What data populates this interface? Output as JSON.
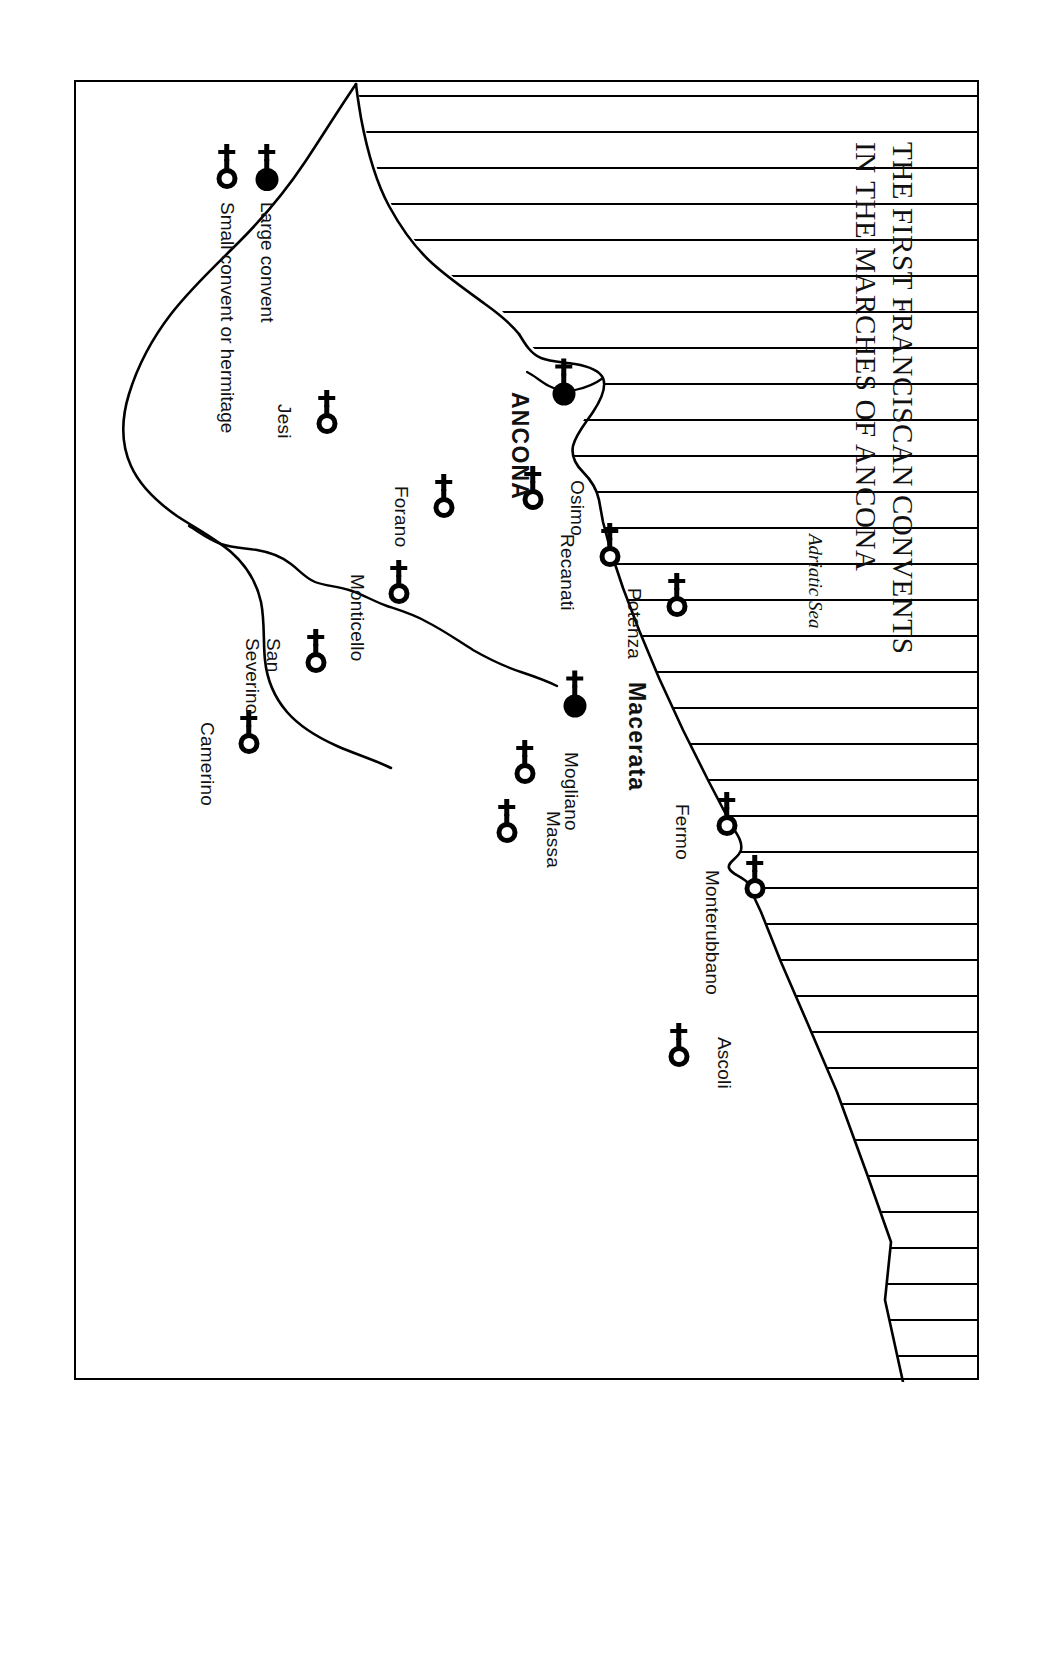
{
  "figure": {
    "title": "THE FIRST FRANCISCAN CONVENTS\nIN THE MARCHES OF ANCONA",
    "orientation_note": "page printed sideways (rotated 90 degrees)"
  },
  "sea": {
    "label": "Adriatic\nSea"
  },
  "legend": {
    "items": [
      {
        "symbol": "large-convent-symbol",
        "label": "Large convent"
      },
      {
        "symbol": "small-convent-symbol",
        "label": "Small convent or hermitage"
      }
    ]
  },
  "map": {
    "places": [
      {
        "name": "ANCONA",
        "type": "large",
        "x": 300,
        "y": 413
      },
      {
        "name": "Macerata",
        "type": "large",
        "x": 612,
        "y": 402
      },
      {
        "name": "Osimo",
        "type": "small",
        "x": 406,
        "y": 444
      },
      {
        "name": "Recanati",
        "type": "small",
        "x": 463,
        "y": 367
      },
      {
        "name": "Potenza",
        "type": "small",
        "x": 513,
        "y": 300
      },
      {
        "name": "Forano",
        "type": "small",
        "x": 414,
        "y": 533
      },
      {
        "name": "Jesi",
        "type": "small",
        "x": 330,
        "y": 650
      },
      {
        "name": "Monticello",
        "type": "small",
        "x": 500,
        "y": 578
      },
      {
        "name": "San\nSeverino",
        "type": "small",
        "x": 569,
        "y": 661
      },
      {
        "name": "Camerino",
        "type": "small",
        "x": 650,
        "y": 728
      },
      {
        "name": "Mogliano",
        "type": "small",
        "x": 680,
        "y": 452
      },
      {
        "name": "Massa",
        "type": "small",
        "x": 739,
        "y": 470
      },
      {
        "name": "Fermo",
        "type": "small",
        "x": 732,
        "y": 250
      },
      {
        "name": "Monterubbano",
        "type": "small",
        "x": 795,
        "y": 222
      },
      {
        "name": "Ascoli",
        "type": "small",
        "x": 963,
        "y": 298
      }
    ],
    "labels": [
      {
        "for": "ANCONA",
        "text": "ANCONA",
        "x": 310,
        "y": 445,
        "style": "big"
      },
      {
        "for": "Macerata",
        "text": "Macerata",
        "x": 600,
        "y": 328,
        "style": "big"
      },
      {
        "for": "Osimo",
        "text": "Osimo",
        "x": 398,
        "y": 390,
        "style": "normal"
      },
      {
        "for": "Recanati",
        "text": "Recanati",
        "x": 452,
        "y": 400,
        "style": "normal"
      },
      {
        "for": "Potenza",
        "text": "Potenza",
        "x": 506,
        "y": 333,
        "style": "normal"
      },
      {
        "for": "Forano",
        "text": "Forano",
        "x": 404,
        "y": 566,
        "style": "normal"
      },
      {
        "for": "Jesi",
        "text": "Jesi",
        "x": 322,
        "y": 683,
        "style": "normal"
      },
      {
        "for": "Monticello",
        "text": "Monticello",
        "x": 492,
        "y": 610,
        "style": "normal"
      },
      {
        "for": "San Severino",
        "text": "San\nSeverino",
        "x": 556,
        "y": 694,
        "style": "normal"
      },
      {
        "for": "Camerino",
        "text": "Camerino",
        "x": 640,
        "y": 760,
        "style": "normal"
      },
      {
        "for": "Mogliano",
        "text": "Mogliano",
        "x": 670,
        "y": 396,
        "style": "normal"
      },
      {
        "for": "Massa",
        "text": "Massa",
        "x": 729,
        "y": 414,
        "style": "normal"
      },
      {
        "for": "Fermo",
        "text": "Fermo",
        "x": 722,
        "y": 285,
        "style": "normal"
      },
      {
        "for": "Monterubbano",
        "text": "Monterubbano",
        "x": 788,
        "y": 255,
        "style": "normal"
      },
      {
        "for": "Ascoli",
        "text": "Ascoli",
        "x": 955,
        "y": 243,
        "style": "normal"
      }
    ],
    "sea_label_pos": {
      "x": 452,
      "y": 150
    },
    "colors": {
      "ink": "#000000",
      "paper": "#ffffff"
    }
  }
}
